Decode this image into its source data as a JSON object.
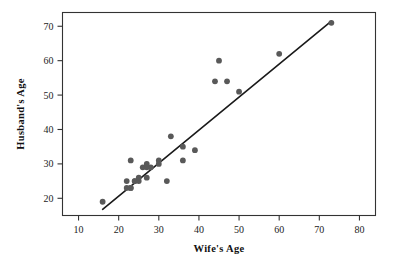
{
  "chart_data": {
    "type": "scatter",
    "title": "",
    "xlabel": "Wife's Age",
    "ylabel": "Husband's Age",
    "xlim": [
      6,
      84
    ],
    "ylim": [
      15,
      74
    ],
    "xticks": [
      10,
      20,
      30,
      40,
      50,
      60,
      70,
      80
    ],
    "yticks": [
      20,
      30,
      40,
      50,
      60,
      70
    ],
    "xtick_labels": [
      "10",
      "20",
      "30",
      "40",
      "50",
      "60",
      "70",
      "80"
    ],
    "ytick_labels": [
      "20",
      "30",
      "40",
      "50",
      "60",
      "70"
    ],
    "grid": false,
    "legend": null,
    "series": [
      {
        "name": "couples",
        "marker": "circle",
        "color": "#595959",
        "x": [
          16,
          22,
          22,
          23,
          23,
          23,
          24,
          24,
          25,
          25,
          26,
          27,
          27,
          27,
          28,
          30,
          30,
          32,
          33,
          36,
          36,
          39,
          44,
          45,
          47,
          50,
          60,
          73
        ],
        "y": [
          19,
          25,
          23,
          31,
          23,
          23,
          25,
          25,
          25,
          26,
          29,
          29,
          30,
          26,
          29,
          31,
          30,
          25,
          38,
          35,
          31,
          34,
          54,
          60,
          54,
          51,
          62,
          71
        ]
      }
    ],
    "fit_line": {
      "name": "regression-line",
      "color": "#1a1a1a",
      "x": [
        16,
        73
      ],
      "y": [
        16.8,
        71.5
      ]
    }
  },
  "axes": {
    "frame_color": "#333333"
  }
}
